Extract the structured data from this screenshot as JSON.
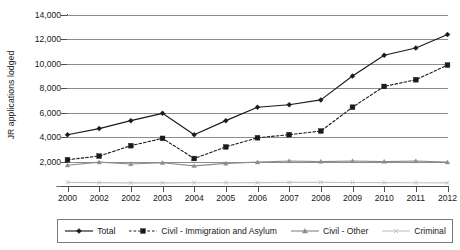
{
  "chart_data": {
    "type": "line",
    "title": "",
    "xlabel": "",
    "ylabel": "JR applications lodged",
    "categories": [
      "2000",
      "2001",
      "2002",
      "2003",
      "2004",
      "2005",
      "2006",
      "2007",
      "2008",
      "2009",
      "2010",
      "2011",
      "2012"
    ],
    "x_tick_labels": [
      "2000",
      "2002",
      "2002",
      "2003",
      "2004",
      "2005",
      "2006",
      "2007",
      "2008",
      "2009",
      "2010",
      "2011",
      "2012"
    ],
    "y_tick_labels": [
      "14,000",
      "12,000",
      "10,000",
      "8,000",
      "6,000",
      "4,000",
      "2,000",
      "–"
    ],
    "y_tick_values": [
      14000,
      12000,
      10000,
      8000,
      6000,
      4000,
      2000,
      0
    ],
    "ylim": [
      0,
      14000
    ],
    "grid": "horizontal",
    "legend_position": "bottom",
    "series": [
      {
        "name": "Total",
        "color": "#1a1a1a",
        "linestyle": "solid",
        "marker": "diamond",
        "values": [
          4200,
          4700,
          5350,
          5950,
          4200,
          5350,
          6450,
          6650,
          7050,
          9000,
          10700,
          11300,
          12400
        ]
      },
      {
        "name": "Civil - Immigration and Asylum",
        "color": "#1a1a1a",
        "linestyle": "dashed",
        "marker": "square",
        "values": [
          2150,
          2450,
          3300,
          3900,
          2250,
          3200,
          3950,
          4200,
          4500,
          6450,
          8150,
          8700,
          9900
        ]
      },
      {
        "name": "Civil - Other",
        "color": "#8c8c8c",
        "linestyle": "solid",
        "marker": "triangle",
        "values": [
          1700,
          1950,
          1800,
          1900,
          1650,
          1850,
          1950,
          2050,
          2000,
          2050,
          2000,
          2050,
          1950
        ]
      },
      {
        "name": "Criminal",
        "color": "#c4c4c4",
        "linestyle": "solid",
        "marker": "x",
        "values": [
          300,
          280,
          260,
          260,
          270,
          270,
          280,
          300,
          300,
          290,
          280,
          270,
          260
        ]
      }
    ]
  },
  "legend": {
    "entries": [
      {
        "label": "Total"
      },
      {
        "label": "Civil - Immigration and Asylum"
      },
      {
        "label": "Civil - Other"
      },
      {
        "label": "Criminal"
      }
    ]
  }
}
